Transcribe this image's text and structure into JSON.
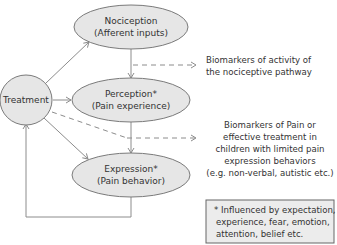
{
  "diagram": {
    "colors": {
      "node_fill": "#e6e6e6",
      "node_stroke": "#7a7a7a",
      "arrow": "#8c8c8c",
      "text": "#333333",
      "note_fill": "#ececec",
      "note_stroke": "#666666"
    },
    "nodes": {
      "treatment": {
        "label": "Treatment"
      },
      "nociception": {
        "line1": "Nociception",
        "line2": "(Afferent inputs)"
      },
      "perception": {
        "line1": "Perception*",
        "line2": "(Pain experience)"
      },
      "expression": {
        "line1": "Expression*",
        "line2": "(Pain behavior)"
      }
    },
    "annotations": {
      "biomarkers_activity": {
        "line1": "Biomarkers of activity of",
        "line2": "the nociceptive pathway"
      },
      "biomarkers_pain": {
        "line1": "Biomarkers of Pain or",
        "line2": "effective treatment in",
        "line3": "children with limited pain",
        "line4": "expression behaviors",
        "line5": "(e.g. non-verbal, autistic etc.)"
      }
    },
    "note": {
      "line1": "* Influenced by expectation,",
      "line2": "experience, fear, emotion,",
      "line3": "attention, belief etc."
    }
  }
}
